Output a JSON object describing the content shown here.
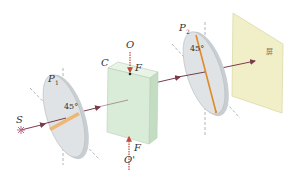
{
  "diagram": {
    "type": "optics-setup",
    "labels": {
      "source": "S",
      "polarizer1": "P",
      "polarizer1_sub": "1",
      "polarizer2": "P",
      "polarizer2_sub": "2",
      "cell": "C",
      "electrode_top": "O",
      "electrode_bottom": "O'",
      "force_top": "F",
      "force_bottom": "F",
      "angle1": "45°",
      "angle2": "45°",
      "screen": "屏"
    },
    "colors": {
      "disk_fill": "#dfe3e6",
      "disk_edge": "#b7bcc0",
      "cell_front": "#d9ecd8",
      "cell_side": "#c3ddc3",
      "cell_top": "#e8f4e6",
      "screen_fill": "#f1efc8",
      "beam": "#7a3b4a",
      "transmission_axis": "#e08a2a",
      "force_arrow": "#c24a3a",
      "dashed_axis": "#9aa3ad",
      "source_star": "#b86a8a"
    }
  }
}
